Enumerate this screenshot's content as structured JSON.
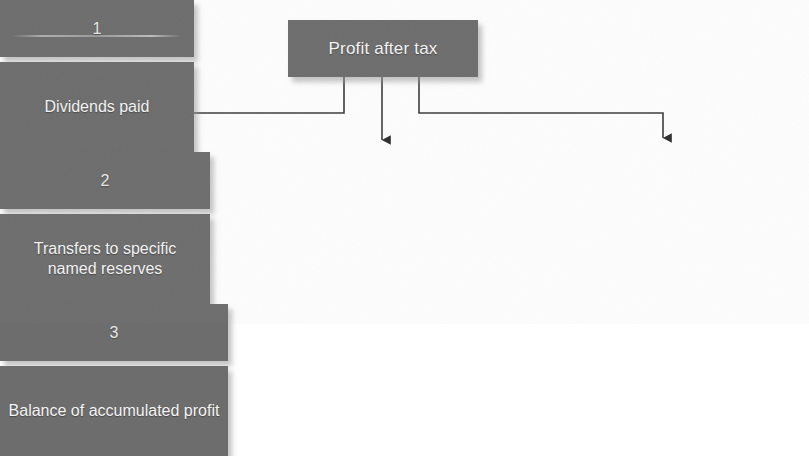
{
  "diagram": {
    "type": "flowchart",
    "root": {
      "id": "profit-after-tax",
      "label": "Profit after tax"
    },
    "branches": [
      {
        "id": "dividends-paid",
        "index": "1",
        "label": "Dividends paid"
      },
      {
        "id": "transfers-to-reserves",
        "index": "2",
        "label": "Transfers to specific named reserves"
      },
      {
        "id": "balance-accumulated-profit",
        "index": "3",
        "label": "Balance of accumulated profit"
      }
    ],
    "connectors": [
      {
        "id": "connector-1",
        "from": "profit-after-tax",
        "to": "dividends-paid",
        "shape": "elbow-left",
        "arrow": "down"
      },
      {
        "id": "connector-2",
        "from": "profit-after-tax",
        "to": "transfers-to-reserves",
        "shape": "straight",
        "arrow": "down"
      },
      {
        "id": "connector-3",
        "from": "profit-after-tax",
        "to": "balance-accumulated-profit",
        "shape": "elbow-right",
        "arrow": "down"
      }
    ],
    "colors": {
      "box_fill": "#6d6d6d",
      "box_text": "#f2f2f2",
      "connector": "#3b3b3b",
      "background": "#fdfdfd",
      "shadow": "#969696"
    }
  }
}
